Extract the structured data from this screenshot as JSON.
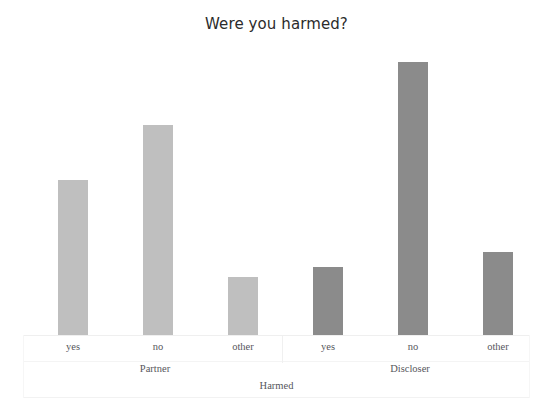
{
  "chart_data": {
    "type": "bar",
    "title": "Were you harmed?",
    "xlabel": "Harmed",
    "ylabel": "",
    "grid": false,
    "legend": "none",
    "groups": [
      "Partner",
      "Discloser"
    ],
    "categories": [
      "yes",
      "no",
      "other"
    ],
    "ylim": [
      0,
      295
    ],
    "series": [
      {
        "name": "Partner",
        "color": "#bfbfbf",
        "categories": [
          "yes",
          "no",
          "other"
        ],
        "values": [
          155,
          210,
          58
        ]
      },
      {
        "name": "Discloser",
        "color": "#8b8b8b",
        "categories": [
          "yes",
          "no",
          "other"
        ],
        "values": [
          68,
          273,
          83
        ]
      }
    ],
    "bars": [
      {
        "group": "Partner",
        "category": "yes",
        "value": 155,
        "color": "#bfbfbf",
        "x": 35,
        "width": 30
      },
      {
        "group": "Partner",
        "category": "no",
        "value": 210,
        "color": "#bfbfbf",
        "x": 120,
        "width": 30
      },
      {
        "group": "Partner",
        "category": "other",
        "value": 58,
        "color": "#bfbfbf",
        "x": 205,
        "width": 30
      },
      {
        "group": "Discloser",
        "category": "yes",
        "value": 68,
        "color": "#8b8b8b",
        "x": 290,
        "width": 30
      },
      {
        "group": "Discloser",
        "category": "no",
        "value": 273,
        "color": "#8b8b8b",
        "x": 375,
        "width": 30
      },
      {
        "group": "Discloser",
        "category": "other",
        "value": 83,
        "color": "#8b8b8b",
        "x": 460,
        "width": 30
      }
    ]
  },
  "chart": {
    "title": "Were you harmed?",
    "xaxis_title": "Harmed",
    "tick_labels": [
      {
        "label": "yes",
        "left": 5
      },
      {
        "label": "no",
        "left": 90
      },
      {
        "label": "other",
        "left": 175
      },
      {
        "label": "yes",
        "left": 260
      },
      {
        "label": "no",
        "left": 345
      },
      {
        "label": "other",
        "left": 430
      }
    ],
    "group_labels": [
      {
        "label": "Partner",
        "left": 42
      },
      {
        "label": "Discloser",
        "left": 297
      }
    ]
  }
}
